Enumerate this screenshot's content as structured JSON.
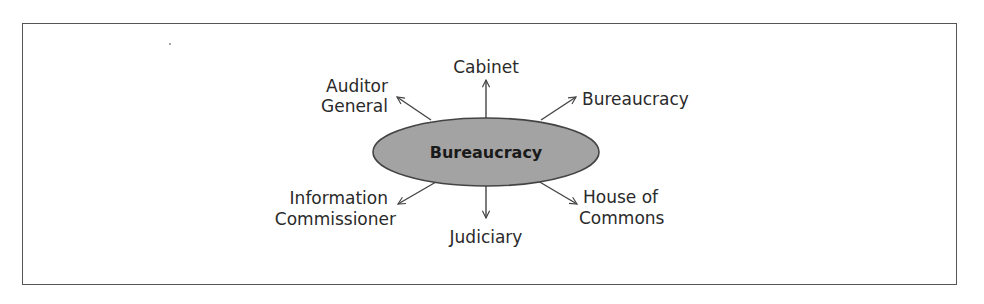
{
  "diagram": {
    "center": {
      "label": "Bureaucracy",
      "fill": "#a3a3a3",
      "stroke": "#444444"
    },
    "nodes": [
      {
        "id": "cabinet",
        "lines": [
          "Cabinet"
        ],
        "position": "top"
      },
      {
        "id": "auditor-general",
        "lines": [
          "Auditor",
          "General"
        ],
        "position": "top-left"
      },
      {
        "id": "bureaucracy",
        "lines": [
          "Bureaucracy"
        ],
        "position": "top-right"
      },
      {
        "id": "information-commissioner",
        "lines": [
          "Information",
          "Commissioner"
        ],
        "position": "bottom-left"
      },
      {
        "id": "judiciary",
        "lines": [
          "Judiciary"
        ],
        "position": "bottom"
      },
      {
        "id": "house-of-commons",
        "lines": [
          "House of",
          "Commons"
        ],
        "position": "bottom-right"
      }
    ],
    "line_color": "#444444",
    "text_color": "#2a2a2a"
  }
}
